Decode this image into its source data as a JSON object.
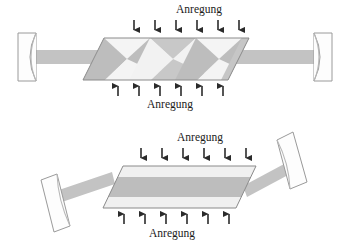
{
  "figure": {
    "title": "",
    "panels": [
      {
        "id": "zigzag-slab-resonator",
        "name": "Zigzag slab laser resonator",
        "top_label": "Anregung",
        "bottom_label": "Anregung",
        "pump_arrows_top_count": 6,
        "pump_arrows_bottom_count": 6,
        "beam_path": "zigzag",
        "mirror_left": "concave-mirror",
        "mirror_right": "concave-mirror"
      },
      {
        "id": "straight-slab-resonator",
        "name": "Tilted slab laser resonator",
        "top_label": "Anregung",
        "bottom_label": "Anregung",
        "pump_arrows_top_count": 6,
        "pump_arrows_bottom_count": 6,
        "beam_path": "straight-tilted",
        "mirror_left": "tilted-concave-mirror",
        "mirror_right": "tilted-concave-mirror"
      }
    ]
  },
  "colors": {
    "beam": "#c3c3c3",
    "beam_light": "#d9d9d9",
    "slab_outline": "#8a8a8a",
    "mirror_outline": "#9a9a9a",
    "mirror_fill": "#fdfdfd",
    "arrow": "#2b2b2b",
    "zig_light": "#f0f0f0",
    "zig_mid": "#c8c8c8",
    "zig_dark": "#b0b0b0",
    "text": "#1a1a1a",
    "background": "#ffffff"
  },
  "geometry": {
    "width": 350,
    "height": 248,
    "panel1": {
      "slab": {
        "x1": 104,
        "y1": 38,
        "x2": 249,
        "y2": 38,
        "x3": 228,
        "y3": 80,
        "x4": 83,
        "y4": 80
      },
      "beam_y": 50,
      "beam_height": 14,
      "arrows_top_y": 20,
      "arrows_top_x": [
        134,
        155,
        176,
        197,
        218,
        239
      ],
      "arrows_bottom_y": 92,
      "arrows_bottom_x": [
        118,
        139,
        160,
        181,
        202,
        223
      ],
      "label_top": {
        "x": 199,
        "y": 13
      },
      "label_bottom": {
        "x": 170,
        "y": 105
      },
      "mirror_left": {
        "x": 18,
        "y": 33,
        "w": 18,
        "h": 48
      },
      "mirror_right": {
        "x": 314,
        "y": 33,
        "w": 18,
        "h": 48
      }
    },
    "panel2": {
      "slab": {
        "x1": 123,
        "y1": 166,
        "x2": 256,
        "y2": 166,
        "x3": 236,
        "y3": 208,
        "x4": 103,
        "y4": 208
      },
      "arrows_top_y": 148,
      "arrows_top_x": [
        141,
        162,
        183,
        204,
        225,
        246
      ],
      "arrows_bottom_y": 220,
      "arrows_bottom_x": [
        124,
        145,
        166,
        187,
        208,
        229
      ],
      "label_top": {
        "x": 200,
        "y": 141
      },
      "label_bottom": {
        "x": 172,
        "y": 234
      }
    }
  },
  "text_values": {
    "anregung": "Anregung"
  }
}
